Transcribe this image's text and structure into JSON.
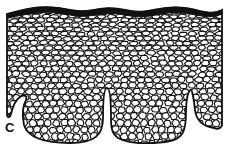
{
  "figure": {
    "panel_label": "C",
    "layers": [
      "stratum corneum (black band)",
      "cell layers (polygonal cells)"
    ],
    "colors": {
      "ink": "#111111",
      "background": "#ffffff"
    },
    "geometry": {
      "outline_path": "M7,14 C30,8 45,4 70,10 C90,15 100,4 125,10 C150,16 160,4 185,8 C200,10 210,16 222,10 L222,124 C222,128 218,130 214,128 C200,126 196,118 195,110 C194,100 192,90 191,90 C188,90 186,100 186,112 C186,130 184,140 165,142 C145,144 130,144 118,138 C112,134 111,128 111,118 C111,100 110,88 107,88 C104,88 103,100 103,118 C103,135 95,143 70,143 C45,143 28,138 24,125 C22,115 23,105 26,100 C28,96 24,94 20,97 C14,101 12,110 11,114 C10,118 7,118 7,114 Z",
      "corneum_top": "M7,14 C30,8 45,4 70,10 C90,15 100,4 125,10 C150,16 160,4 185,8 C200,10 210,16 222,10",
      "corneum_bottom": "M222,14 C210,20 200,15 185,13 C160,10 150,21 125,15 C100,10 90,20 70,15 C45,9 30,14 7,18"
    }
  }
}
